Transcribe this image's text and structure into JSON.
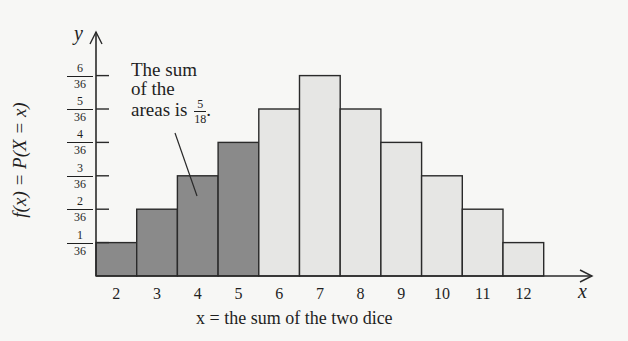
{
  "chart_data": {
    "type": "bar",
    "title": "",
    "xlabel": "x = the sum of the two dice",
    "ylabel": "f(x) = P(X = x)",
    "x_axis_letter": "x",
    "y_axis_letter": "y",
    "categories": [
      "2",
      "3",
      "4",
      "5",
      "6",
      "7",
      "8",
      "9",
      "10",
      "11",
      "12"
    ],
    "values": [
      0.027778,
      0.055556,
      0.083333,
      0.111111,
      0.138889,
      0.166667,
      0.138889,
      0.111111,
      0.083333,
      0.055556,
      0.027778
    ],
    "values_fraction": [
      "1/36",
      "2/36",
      "3/36",
      "4/36",
      "5/36",
      "6/36",
      "5/36",
      "4/36",
      "3/36",
      "2/36",
      "1/36"
    ],
    "numerators": [
      1,
      2,
      3,
      4,
      5,
      6,
      5,
      4,
      3,
      2,
      1
    ],
    "denominator": 36,
    "highlighted_categories": [
      "2",
      "3",
      "4",
      "5"
    ],
    "y_ticks": [
      {
        "num": "1",
        "den": "36"
      },
      {
        "num": "2",
        "den": "36"
      },
      {
        "num": "3",
        "den": "36"
      },
      {
        "num": "4",
        "den": "36"
      },
      {
        "num": "5",
        "den": "36"
      },
      {
        "num": "6",
        "den": "36"
      }
    ],
    "ylim": [
      0,
      0.1944
    ],
    "grid": false,
    "legend": null,
    "annotation": {
      "line1": "The sum",
      "line2": "of the",
      "line3": "areas is",
      "frac_num": "5",
      "frac_den": "18",
      "suffix": ".",
      "points_to": "4"
    },
    "colors": {
      "highlighted_fill": "#8a8a8a",
      "normal_fill": "#e6e6e4",
      "stroke": "#2a2a2a",
      "background": "#f7f7f5"
    }
  }
}
